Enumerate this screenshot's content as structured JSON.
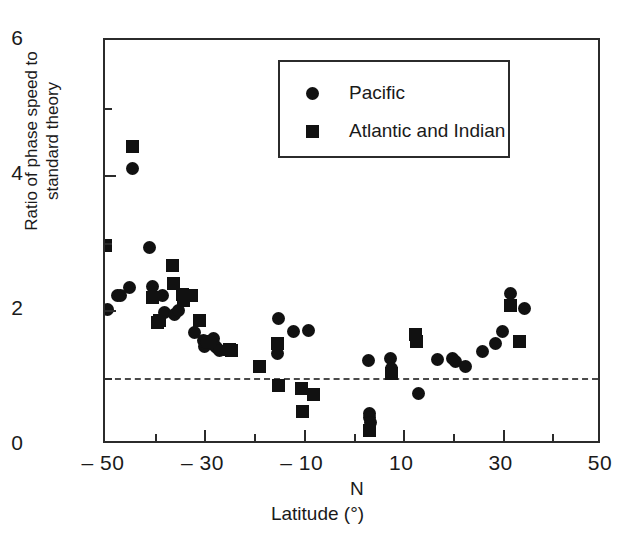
{
  "chart_data": {
    "type": "scatter",
    "title": "",
    "xlabel": "Latitude (°)",
    "ylabel": "Ratio of phase speed to standard theory",
    "hemisphere_marker": "N",
    "xlim": [
      -50,
      50
    ],
    "ylim": [
      0,
      6
    ],
    "x_ticks_major": [
      -50,
      -30,
      -10,
      10,
      30,
      50
    ],
    "x_ticks_major_labels": [
      "-50",
      "-30",
      "-10",
      "10",
      "30",
      "50"
    ],
    "x_ticks_minor": [
      -40,
      -20,
      0,
      20,
      40
    ],
    "y_ticks_major": [
      0,
      2,
      4,
      6
    ],
    "y_ticks_major_labels": [
      "0",
      "2",
      "4",
      "6"
    ],
    "y_ticks_minor": [
      1,
      3,
      5
    ],
    "grid": false,
    "legend_position": "top-center",
    "reference_line": {
      "value": 1,
      "style": "dashed",
      "color": "#4a4a4a"
    },
    "series": [
      {
        "name": "Pacific",
        "marker": "circle",
        "color": "#111111",
        "points": [
          [
            -44.5,
            4.09
          ],
          [
            -49.5,
            2.01
          ],
          [
            -47.5,
            2.22
          ],
          [
            -46.8,
            2.21
          ],
          [
            -45.0,
            2.33
          ],
          [
            -41.0,
            2.92
          ],
          [
            -40.5,
            2.35
          ],
          [
            -38.5,
            2.21
          ],
          [
            -38.0,
            1.97
          ],
          [
            -36.0,
            1.94
          ],
          [
            -35.2,
            2.0
          ],
          [
            -32.0,
            1.66
          ],
          [
            -30.2,
            1.55
          ],
          [
            -30.0,
            1.46
          ],
          [
            -29.5,
            1.52
          ],
          [
            -28.2,
            1.58
          ],
          [
            -28.0,
            1.48
          ],
          [
            -27.5,
            1.44
          ],
          [
            -27.0,
            1.4
          ],
          [
            -15.0,
            1.88
          ],
          [
            -15.2,
            1.35
          ],
          [
            -12.0,
            1.68
          ],
          [
            -9.0,
            1.7
          ],
          [
            3.0,
            1.25
          ],
          [
            3.2,
            0.47
          ],
          [
            3.3,
            0.41
          ],
          [
            3.4,
            0.34
          ],
          [
            7.5,
            1.28
          ],
          [
            7.6,
            1.14
          ],
          [
            13.0,
            0.76
          ],
          [
            17.0,
            1.26
          ],
          [
            20.0,
            1.28
          ],
          [
            20.5,
            1.24
          ],
          [
            22.5,
            1.16
          ],
          [
            26.0,
            1.38
          ],
          [
            28.5,
            1.51
          ],
          [
            30.0,
            1.68
          ],
          [
            31.5,
            2.25
          ],
          [
            34.5,
            2.02
          ]
        ]
      },
      {
        "name": "Atlantic and Indian",
        "marker": "square",
        "color": "#111111",
        "points": [
          [
            -44.5,
            4.42
          ],
          [
            -49.8,
            2.95
          ],
          [
            -40.5,
            2.18
          ],
          [
            -39.5,
            1.82
          ],
          [
            -39.0,
            1.85
          ],
          [
            -36.5,
            2.66
          ],
          [
            -36.2,
            2.4
          ],
          [
            -34.5,
            2.23
          ],
          [
            -34.2,
            2.14
          ],
          [
            -32.5,
            2.22
          ],
          [
            -31.0,
            1.85
          ],
          [
            -29.0,
            1.54
          ],
          [
            -25.0,
            1.42
          ],
          [
            -24.5,
            1.4
          ],
          [
            -19.0,
            1.17
          ],
          [
            -15.2,
            1.5
          ],
          [
            -15.0,
            0.88
          ],
          [
            -10.5,
            0.84
          ],
          [
            -10.3,
            0.49
          ],
          [
            -8.0,
            0.75
          ],
          [
            3.3,
            0.22
          ],
          [
            7.6,
            1.06
          ],
          [
            12.5,
            1.63
          ],
          [
            12.6,
            1.53
          ],
          [
            31.5,
            2.07
          ],
          [
            33.5,
            1.53
          ]
        ]
      }
    ]
  },
  "legend": {
    "items": [
      {
        "label": "Pacific",
        "marker": "circle"
      },
      {
        "label": "Atlantic and Indian",
        "marker": "square"
      }
    ]
  }
}
